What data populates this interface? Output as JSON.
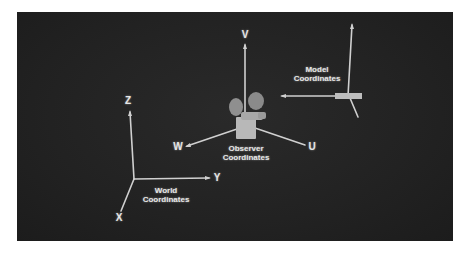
{
  "diagram": {
    "background_color": "#222222",
    "axis_color": "#d8d8d8",
    "systems": [
      {
        "name": "World Coordinates",
        "line1": "World",
        "line2": "Coordinates",
        "axes": [
          "X",
          "Y",
          "Z"
        ]
      },
      {
        "name": "Observer Coordinates",
        "line1": "Observer",
        "line2": "Coordinates",
        "axes": [
          "U",
          "V",
          "W"
        ]
      },
      {
        "name": "Model Coordinates",
        "line1": "Model",
        "line2": "Coordinates",
        "axes": []
      }
    ],
    "axis_labels": {
      "z": "Z",
      "y": "Y",
      "x": "X",
      "v": "V",
      "w": "W",
      "u": "U"
    },
    "icons": [
      "camera-icon"
    ]
  }
}
